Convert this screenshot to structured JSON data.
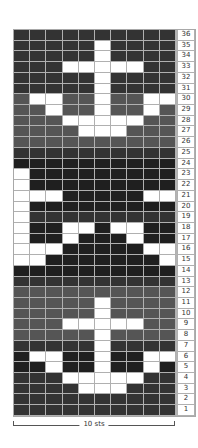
{
  "chart_data": {
    "type": "table",
    "columns": 10,
    "rows": 36,
    "width_label": "10 sts",
    "colors": {
      "W": "#ffffff",
      "K": "#1f1f1f",
      "D": "#333333",
      "G": "#555555"
    },
    "row_data": [
      {
        "row": 36,
        "bg": "D",
        "cells": "DDDDDDDDDD"
      },
      {
        "row": 35,
        "bg": "D",
        "cells": "DDDDDWDDDD"
      },
      {
        "row": 34,
        "bg": "D",
        "cells": "DDDDDWDDDD"
      },
      {
        "row": 33,
        "bg": "D",
        "cells": "DDDWWWWWDD"
      },
      {
        "row": 32,
        "bg": "D",
        "cells": "DDDDDWDDDD"
      },
      {
        "row": 31,
        "bg": "D",
        "cells": "DDDDDWDDDD"
      },
      {
        "row": 30,
        "bg": "G",
        "cells": "GWWGGWGGWW"
      },
      {
        "row": 29,
        "bg": "G",
        "cells": "GGWGGWGGWG"
      },
      {
        "row": 28,
        "bg": "G",
        "cells": "GGGWWWWWGG"
      },
      {
        "row": 27,
        "bg": "G",
        "cells": "GGGGWWWGGG"
      },
      {
        "row": 26,
        "bg": "G",
        "cells": "GGGGGGGGGG"
      },
      {
        "row": 25,
        "bg": "D",
        "cells": "DDDDDDDDDD"
      },
      {
        "row": 24,
        "bg": "K",
        "cells": "KKKKKKKKKK"
      },
      {
        "row": 23,
        "bg": "K",
        "cells": "WKKKKKKKKK"
      },
      {
        "row": 22,
        "bg": "K",
        "cells": "WKKKKKKKKK"
      },
      {
        "row": 21,
        "bg": "K",
        "cells": "WWWKKKKKWW"
      },
      {
        "row": 20,
        "bg": "K",
        "cells": "WKKKKKKKKK"
      },
      {
        "row": 19,
        "bg": "D",
        "cells": "WDDDDDDDDD"
      },
      {
        "row": 18,
        "bg": "K",
        "cells": "WKKWWKWWKK"
      },
      {
        "row": 17,
        "bg": "K",
        "cells": "WKKWKKKWKK"
      },
      {
        "row": 16,
        "bg": "K",
        "cells": "WWWKKKKKWW"
      },
      {
        "row": 15,
        "bg": "K",
        "cells": "WWKKKKKKKW"
      },
      {
        "row": 14,
        "bg": "K",
        "cells": "KKKKKKKKKK"
      },
      {
        "row": 13,
        "bg": "D",
        "cells": "DDDDDDDDDD"
      },
      {
        "row": 12,
        "bg": "G",
        "cells": "GGGGGGGGGG"
      },
      {
        "row": 11,
        "bg": "G",
        "cells": "GGGGGWGGGG"
      },
      {
        "row": 10,
        "bg": "G",
        "cells": "GGGGGWGGGG"
      },
      {
        "row": 9,
        "bg": "G",
        "cells": "GGGWWWWWGG"
      },
      {
        "row": 8,
        "bg": "G",
        "cells": "GGGGGWGGGG"
      },
      {
        "row": 7,
        "bg": "D",
        "cells": "DDDDDWDDDD"
      },
      {
        "row": 6,
        "bg": "K",
        "cells": "KWWKKWKKWW"
      },
      {
        "row": 5,
        "bg": "K",
        "cells": "KKWKKWKKWK"
      },
      {
        "row": 4,
        "bg": "D",
        "cells": "DDDWWWWWDD"
      },
      {
        "row": 3,
        "bg": "D",
        "cells": "DDDDWWWDDD"
      },
      {
        "row": 2,
        "bg": "D",
        "cells": "DDDDDDDDDD"
      },
      {
        "row": 1,
        "bg": "D",
        "cells": "DDDDDDDDDD"
      }
    ]
  }
}
